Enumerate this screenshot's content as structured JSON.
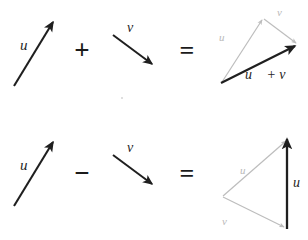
{
  "figure": {
    "background_color": "#ffffff",
    "dark_color": "#1f1f1f",
    "gray_color": "#bdbdbd",
    "width": 308,
    "height": 240
  },
  "rows": [
    {
      "id": "addition-row",
      "operator": "+",
      "equals": "=",
      "operand_left_label": "u⃗",
      "operand_right_label": "v⃗",
      "result_label": "u⃗ + v⃗",
      "triangle_u_label": "u⃗",
      "triangle_v_label": "v⃗"
    },
    {
      "id": "subtraction-row",
      "operator": "−",
      "equals": "=",
      "operand_left_label": "u⃗",
      "operand_right_label": "v⃗",
      "result_label": "u⃗ − v⃗",
      "triangle_u_label": "u⃗",
      "triangle_v_label": "v⃗"
    }
  ],
  "labels": {
    "u_plain": "u",
    "v_plain": "v",
    "plus": "+",
    "minus": "−",
    "equals": "=",
    "sum_expression": "u⃗ + v⃗",
    "difference_expression": "u⃗ − v⃗"
  },
  "glyphs": {
    "u_arrow_accent": "u⃗",
    "v_arrow_accent": "v⃗"
  }
}
